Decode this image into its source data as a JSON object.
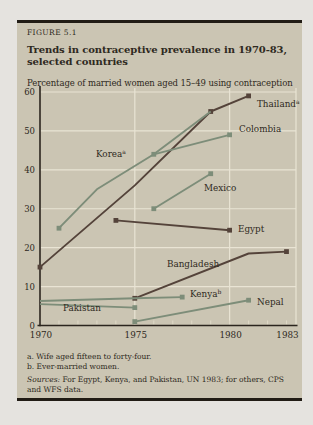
{
  "figure": {
    "label": "FIGURE 5.1",
    "title_line1": "Trends in contraceptive prevalence in 1970-83,",
    "title_line2": "selected countries",
    "subtitle": "Percentage of married women aged 15–49 using contraception"
  },
  "chart_data": {
    "type": "line",
    "title": "Trends in contraceptive prevalence in 1970-83, selected countries",
    "ylabel": "Percentage of married women aged 15–49 using contraception",
    "xlabel": "",
    "xlim": [
      1970,
      1983.5
    ],
    "ylim": [
      0,
      60
    ],
    "x_ticks": [
      1970,
      1975,
      1980,
      1983
    ],
    "y_ticks": [
      0,
      10,
      20,
      30,
      40,
      50,
      60
    ],
    "grid": true,
    "legend_position": "labels-on-lines",
    "series": [
      {
        "name": "Thailand",
        "sup": "a",
        "color": "#54433a",
        "points": [
          [
            1970,
            15
          ],
          [
            1975,
            36
          ],
          [
            1979,
            55
          ],
          [
            1981,
            59
          ]
        ],
        "markers": [
          [
            1970,
            15
          ],
          [
            1979,
            55
          ],
          [
            1981,
            59
          ]
        ],
        "label_at": [
          257,
          107
        ]
      },
      {
        "name": "Korea",
        "sup": "a",
        "color": "#7d8d79",
        "points": [
          [
            1971,
            25
          ],
          [
            1973,
            35
          ],
          [
            1976,
            44
          ],
          [
            1979,
            55
          ]
        ],
        "markers": [
          [
            1971,
            25
          ]
        ],
        "label_at": [
          96,
          157
        ]
      },
      {
        "name": "Colombia",
        "sup": "",
        "color": "#7d8d79",
        "points": [
          [
            1976,
            44
          ],
          [
            1980,
            49
          ]
        ],
        "markers": [
          [
            1976,
            44
          ],
          [
            1980,
            49
          ]
        ],
        "label_at": [
          239,
          132
        ]
      },
      {
        "name": "Mexico",
        "sup": "",
        "color": "#7d8d79",
        "points": [
          [
            1976,
            30
          ],
          [
            1979,
            39
          ]
        ],
        "markers": [
          [
            1976,
            30
          ],
          [
            1979,
            39
          ]
        ],
        "label_at": [
          204,
          191
        ]
      },
      {
        "name": "Egypt",
        "sup": "",
        "color": "#54433a",
        "points": [
          [
            1974,
            27
          ],
          [
            1980,
            24.5
          ]
        ],
        "markers": [
          [
            1974,
            27
          ],
          [
            1980,
            24.5
          ]
        ],
        "label_at": [
          238,
          232
        ]
      },
      {
        "name": "Bangladesh",
        "sup": "",
        "color": "#54433a",
        "points": [
          [
            1975,
            7
          ],
          [
            1981,
            18.5
          ],
          [
            1983,
            19
          ]
        ],
        "markers": [
          [
            1975,
            7
          ],
          [
            1983,
            19
          ]
        ],
        "label_at": [
          167,
          267
        ]
      },
      {
        "name": "Kenya",
        "sup": "b",
        "color": "#7d8d79",
        "points": [
          [
            1970,
            6.3
          ],
          [
            1975,
            7
          ],
          [
            1977.5,
            7.3
          ]
        ],
        "markers": [
          [
            1977.5,
            7.3
          ]
        ],
        "label_at": [
          190,
          297
        ]
      },
      {
        "name": "Nepal",
        "sup": "",
        "color": "#7d8d79",
        "points": [
          [
            1975,
            1
          ],
          [
            1981,
            6.5
          ]
        ],
        "markers": [
          [
            1975,
            1
          ],
          [
            1981,
            6.5
          ]
        ],
        "label_at": [
          257,
          305
        ]
      },
      {
        "name": "Pakistan",
        "sup": "",
        "color": "#7d8d79",
        "points": [
          [
            1970,
            5.5
          ],
          [
            1975,
            4.6
          ]
        ],
        "markers": [
          [
            1975,
            4.6
          ]
        ],
        "label_at": [
          63,
          311
        ]
      }
    ]
  },
  "footnotes": {
    "a": "a. Wife aged fifteen to forty-four.",
    "b": "b. Ever-married women."
  },
  "sources": {
    "label": "Sources:",
    "text": "For Egypt, Kenya, and Pakistan, UN 1983; for others, CPS and WFS data."
  },
  "colors": {
    "page_bg": "#e5e3df",
    "panel_bg": "#cbc5b3",
    "rule": "#211c15",
    "dark_line": "#54433a",
    "green_line": "#7d8d79",
    "grid": "#e9e4d4",
    "minor_tick": "#ded8c6",
    "axis": "#2b251e",
    "text": "#2e2921"
  }
}
